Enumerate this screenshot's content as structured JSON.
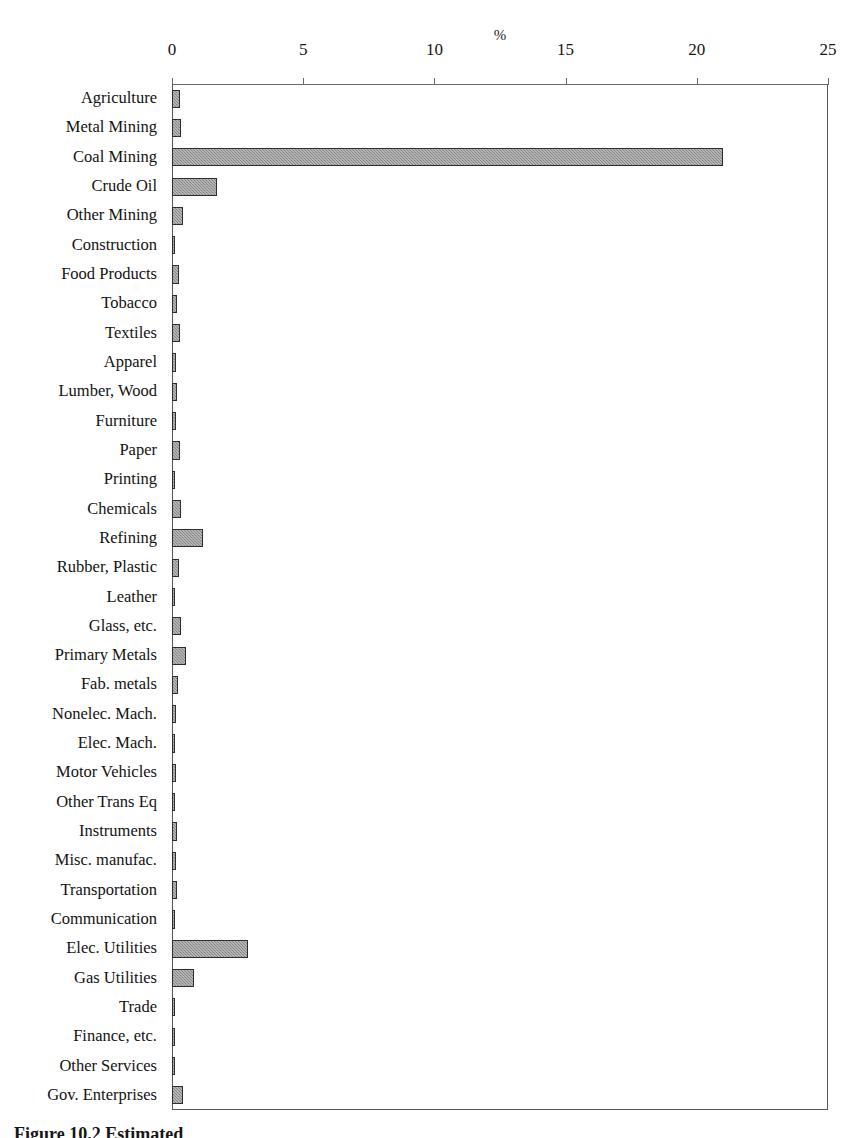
{
  "chart_data": {
    "type": "bar",
    "orientation": "horizontal",
    "title": "",
    "xlabel": "%",
    "ylabel": "",
    "xlim": [
      0,
      25
    ],
    "xticks": [
      0,
      5,
      10,
      15,
      20,
      25
    ],
    "xtick_labels": [
      "0",
      "5",
      "10",
      "15",
      "20",
      "25"
    ],
    "grid": false,
    "legend": null,
    "bar_color": "#8d8d8d",
    "bar_edge_color": "#2e2e2e",
    "categories": [
      "Agriculture",
      "Metal Mining",
      "Coal Mining",
      "Crude Oil",
      "Other Mining",
      "Construction",
      "Food Products",
      "Tobacco",
      "Textiles",
      "Apparel",
      "Lumber, Wood",
      "Furniture",
      "Paper",
      "Printing",
      "Chemicals",
      "Refining",
      "Rubber, Plastic",
      "Leather",
      "Glass, etc.",
      "Primary Metals",
      "Fab. metals",
      "Nonelec. Mach.",
      "Elec. Mach.",
      "Motor Vehicles",
      "Other Trans Eq",
      "Instruments",
      "Misc. manufac.",
      "Transportation",
      "Communication",
      "Elec. Utilities",
      "Gas Utilities",
      "Trade",
      "Finance, etc.",
      "Other Services",
      "Gov. Enterprises"
    ],
    "values": [
      0.3,
      0.35,
      21.0,
      1.7,
      0.42,
      0.12,
      0.26,
      0.18,
      0.32,
      0.16,
      0.2,
      0.14,
      0.3,
      0.12,
      0.34,
      1.2,
      0.28,
      0.1,
      0.36,
      0.52,
      0.22,
      0.14,
      0.1,
      0.16,
      0.12,
      0.18,
      0.14,
      0.2,
      0.12,
      2.9,
      0.85,
      0.12,
      0.1,
      0.12,
      0.42
    ]
  },
  "axis": {
    "x_title": "%"
  },
  "caption": {
    "text": "Figure 10.2  Estimated"
  }
}
